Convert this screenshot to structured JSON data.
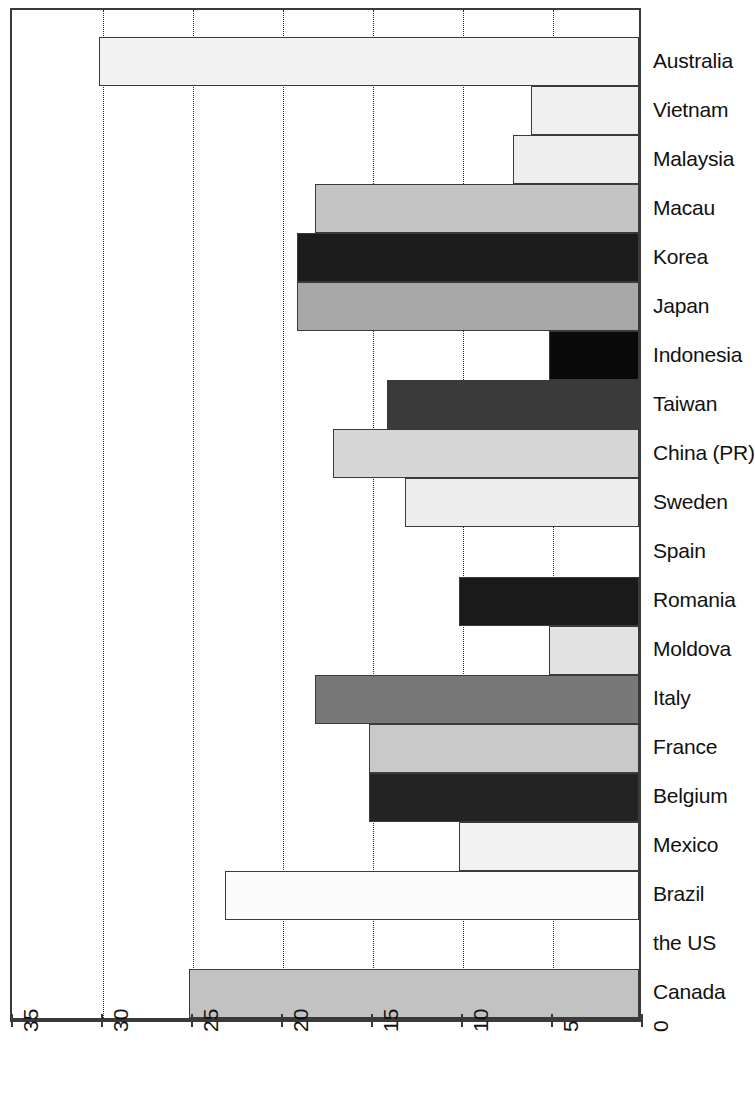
{
  "chart_data": {
    "type": "bar",
    "orientation": "horizontal",
    "title": "",
    "xlabel": "",
    "ylabel": "",
    "xlim": [
      35,
      0
    ],
    "x_axis_reversed": true,
    "x_ticks": [
      35,
      30,
      25,
      20,
      15,
      10,
      5,
      0
    ],
    "x_tick_labels": [
      "35",
      "30",
      "25",
      "20",
      "15",
      "10",
      "5",
      "0"
    ],
    "grid": "vertical-dotted",
    "legend": "none",
    "categories": [
      "Australia",
      "Vietnam",
      "Malaysia",
      "Macau",
      "Korea",
      "Japan",
      "Indonesia",
      "Taiwan",
      "China (PR)",
      "Sweden",
      "Spain",
      "Romania",
      "Moldova",
      "Italy",
      "France",
      "Belgium",
      "Mexico",
      "Brazil",
      "the US",
      "Canada"
    ],
    "values": [
      30,
      6,
      7,
      18,
      19,
      19,
      5,
      14,
      17,
      13,
      0,
      10,
      5,
      18,
      15,
      15,
      10,
      23,
      0,
      25
    ],
    "bar_colors": [
      "#f2f2f2",
      "#efefef",
      "#eeeeee",
      "#c4c4c4",
      "#1c1c1c",
      "#a8a8a8",
      "#0a0a0a",
      "#3a3a3a",
      "#d6d6d6",
      "#ededed",
      "#ffffff",
      "#1a1a1a",
      "#e2e2e2",
      "#787878",
      "#c9c9c9",
      "#232323",
      "#f2f2f2",
      "#fbfbfb",
      "#ffffff",
      "#c2c2c2"
    ]
  },
  "axis": {
    "tick_labels": [
      "35",
      "30",
      "25",
      "20",
      "15",
      "10",
      "5",
      "0"
    ]
  },
  "labels": {
    "items": [
      "Australia",
      "Vietnam",
      "Malaysia",
      "Macau",
      "Korea",
      "Japan",
      "Indonesia",
      "Taiwan",
      "China (PR)",
      "Sweden",
      "Spain",
      "Romania",
      "Moldova",
      "Italy",
      "France",
      "Belgium",
      "Mexico",
      "Brazil",
      "the US",
      "Canada"
    ]
  }
}
